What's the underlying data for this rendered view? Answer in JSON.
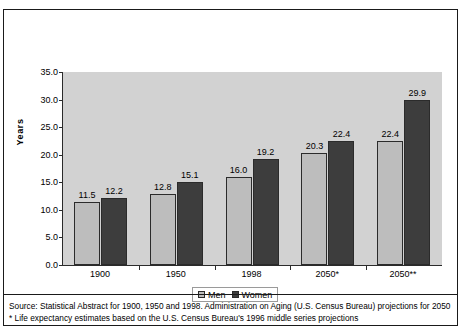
{
  "chart_data": {
    "type": "bar",
    "title": "",
    "xlabel": "",
    "ylabel": "Years",
    "ylim": [
      0,
      35
    ],
    "ytick_labels": [
      "35.0",
      "30.0",
      "25.0",
      "20.0",
      "15.0",
      "10.0",
      "5.0",
      "0.0"
    ],
    "ytick_values": [
      35,
      30,
      25,
      20,
      15,
      10,
      5,
      0
    ],
    "grid": false,
    "legend_position": "bottom-center",
    "categories": [
      "1900",
      "1950",
      "1998",
      "2050*",
      "2050**"
    ],
    "series": [
      {
        "name": "Men",
        "color": "#bdbdbd",
        "values": [
          11.5,
          12.8,
          16.0,
          20.3,
          22.4
        ],
        "labels": [
          "11.5",
          "12.8",
          "16.0",
          "20.3",
          "22.4"
        ]
      },
      {
        "name": "Women",
        "color": "#3d3d3d",
        "values": [
          12.2,
          15.1,
          19.2,
          22.4,
          29.9
        ],
        "labels": [
          "12.2",
          "15.1",
          "19.2",
          "22.4",
          "29.9"
        ]
      }
    ],
    "annotations": [
      "Source: Statistical Abstract for 1900, 1950 and 1998. Administration on Aging (U.S. Census Bureau) projections for 2050",
      "* Life expectancy estimates based on the U.S. Census Bureau's 1996 middle series projections"
    ]
  },
  "legend": {
    "items": [
      {
        "label": "Men"
      },
      {
        "label": "Women"
      }
    ]
  },
  "footnotes": {
    "source_line": "Source: Statistical Abstract for 1900, 1950 and 1998. Administration on Aging (U.S. Census Bureau) projections for 2050",
    "asterisk_line": "* Life expectancy estimates based on the U.S. Census Bureau's 1996 middle series projections"
  },
  "colors": {
    "men_bar": "#bdbdbd",
    "women_bar": "#3d3d3d",
    "plot_background": "#d2d2d2",
    "axis": "#2b2b2b",
    "frame": "#1a1a1a"
  }
}
